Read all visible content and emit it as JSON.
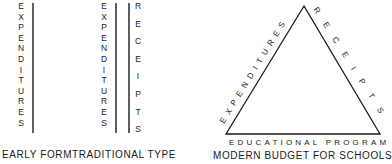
{
  "panels": [
    {
      "id": "early-form",
      "caption": "EARLY FORM",
      "columns": [
        {
          "label": "EXPENDITURES"
        }
      ]
    },
    {
      "id": "traditional-type",
      "caption": "TRADITIONAL TYPE",
      "columns": [
        {
          "label": "EXPENDITURES"
        },
        {
          "label": "RECEIPTS"
        }
      ]
    },
    {
      "id": "modern-budget",
      "caption": "MODERN BUDGET FOR SCHOOLS",
      "triangle": {
        "left_side": "EXPENDITURES",
        "right_side": "RECEIPTS",
        "base": "EDUCATIONAL PROGRAM"
      }
    }
  ],
  "colors": {
    "ink": "#1a1a1a",
    "background": "#ffffff"
  }
}
